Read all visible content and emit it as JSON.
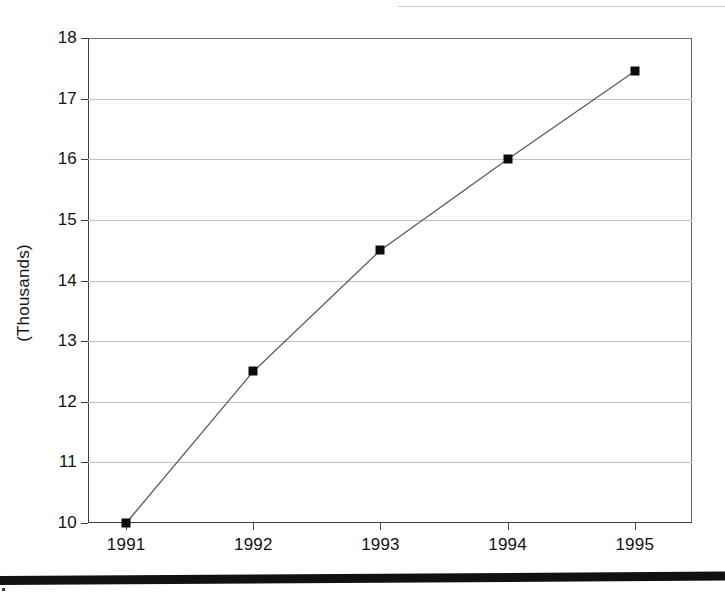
{
  "document": {
    "figure_kind": "line-chart-scan",
    "has_top_rule": true,
    "has_bottom_rule": true
  },
  "axis": {
    "y_label": "(Thousands)",
    "y_ticks": [
      "18",
      "17",
      "16",
      "15",
      "14",
      "13",
      "12",
      "11",
      "10"
    ],
    "x_ticks": [
      "1991",
      "1992",
      "1993",
      "1994",
      "1995"
    ]
  },
  "colors": {
    "line": "#5a5a5a",
    "marker": "#0b0b0b",
    "grid": "#c2c2c2",
    "frame": "#3c3c3c",
    "text": "#121212",
    "background": "#ffffff",
    "rule": "#111111"
  },
  "chart_data": {
    "type": "line",
    "title": "",
    "subtitle": "",
    "xlabel": "",
    "ylabel": "(Thousands)",
    "categories": [
      "1991",
      "1992",
      "1993",
      "1994",
      "1995"
    ],
    "x": [
      1991,
      1992,
      1993,
      1994,
      1995
    ],
    "values": [
      10.0,
      12.5,
      14.5,
      16.0,
      17.45
    ],
    "series": [
      {
        "name": "",
        "values": [
          10.0,
          12.5,
          14.5,
          16.0,
          17.45
        ]
      }
    ],
    "ylim": [
      10,
      18
    ],
    "yticks": [
      10,
      11,
      12,
      13,
      14,
      15,
      16,
      17,
      18
    ],
    "xlim": [
      1990.7,
      1995.45
    ],
    "grid": "horizontal",
    "legend": "none",
    "marker": "square",
    "annotations": []
  }
}
